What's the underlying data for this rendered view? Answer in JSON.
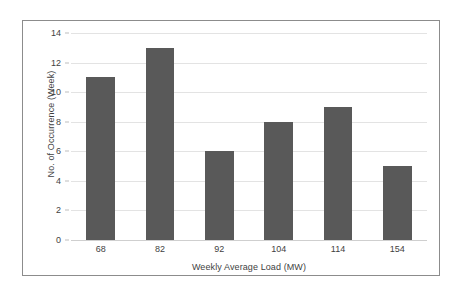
{
  "chart_data": {
    "type": "bar",
    "title": "",
    "subtitle": "",
    "categories": [
      "68",
      "82",
      "92",
      "104",
      "114",
      "154"
    ],
    "values": [
      11,
      13,
      6,
      8,
      9,
      5
    ],
    "series": [
      {
        "name": "No. of Occurrence (Week)",
        "values": [
          11,
          13,
          6,
          8,
          9,
          5
        ]
      }
    ],
    "xlabel": "Weekly Average Load (MW)",
    "ylabel": "No. of Occurrence (Week)",
    "ylim": [
      0,
      14
    ],
    "ytick_labels": [
      "0",
      "2",
      "4",
      "6",
      "8",
      "10",
      "12",
      "14"
    ],
    "ytick_values": [
      0,
      2,
      4,
      6,
      8,
      10,
      12,
      14
    ],
    "xtick_labels": [
      "68",
      "82",
      "92",
      "104",
      "114",
      "154"
    ],
    "grid": "horizontal",
    "legend": "none",
    "annotations": [],
    "colors": {
      "bar": "#595959",
      "gridline": "#e3e3e3",
      "axis": "#cfcfcf",
      "text": "#3f3f3f",
      "frame_border": "#8c8c8c",
      "background": "#ffffff"
    }
  }
}
